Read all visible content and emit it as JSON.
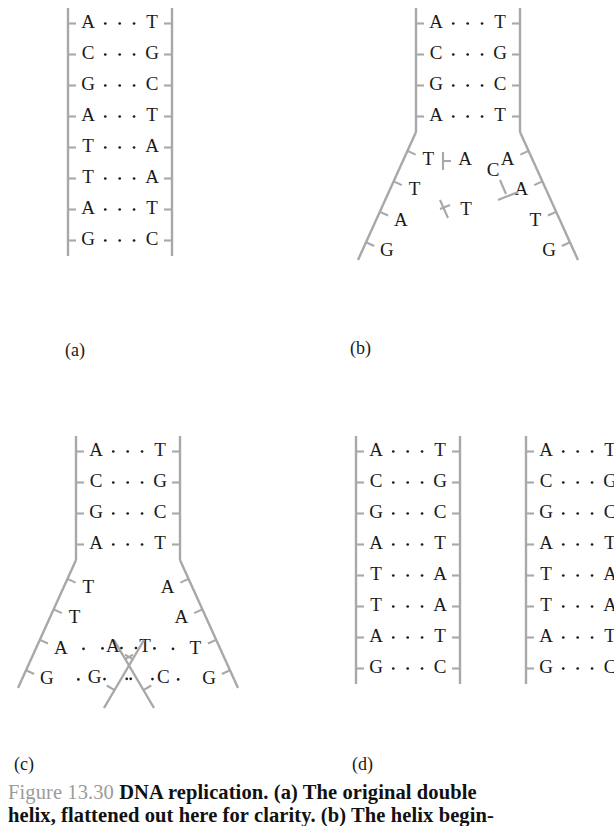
{
  "figure": {
    "number": "Figure 13.30",
    "caption_line1": "DNA replication. (a) The original double",
    "caption_line2": "helix, flattened out here for clarity. (b) The helix begin-",
    "title": "DNA replication"
  },
  "colors": {
    "backbone": "#a8a8a8",
    "base_text": "#1a1a1a",
    "figure_number": "#9b9b9b",
    "background": "#ffffff"
  },
  "panels": [
    {
      "id": "a",
      "label": "(a)",
      "description": "The original double helix, flattened out for clarity",
      "base_pairs": [
        {
          "left": "A",
          "right": "T"
        },
        {
          "left": "C",
          "right": "G"
        },
        {
          "left": "G",
          "right": "C"
        },
        {
          "left": "A",
          "right": "T"
        },
        {
          "left": "T",
          "right": "A"
        },
        {
          "left": "T",
          "right": "A"
        },
        {
          "left": "A",
          "right": "T"
        },
        {
          "left": "G",
          "right": "C"
        }
      ]
    },
    {
      "id": "b",
      "label": "(b)",
      "description": "The helix begins to unwind, free nucleotides approach the exposed bases",
      "paired_region": [
        {
          "left": "A",
          "right": "T"
        },
        {
          "left": "C",
          "right": "G"
        },
        {
          "left": "G",
          "right": "C"
        },
        {
          "left": "A",
          "right": "T"
        }
      ],
      "left_unpaired": [
        "T",
        "T",
        "A",
        "G"
      ],
      "right_unpaired": [
        "A",
        "A",
        "T",
        "G"
      ],
      "free_nucleotides": [
        "A",
        "T",
        "C"
      ]
    },
    {
      "id": "c",
      "label": "(c)",
      "description": "New complementary strands form along each template strand",
      "paired_region": [
        {
          "left": "A",
          "right": "T"
        },
        {
          "left": "C",
          "right": "G"
        },
        {
          "left": "G",
          "right": "C"
        },
        {
          "left": "A",
          "right": "T"
        }
      ],
      "left_template": [
        "T",
        "T",
        "A",
        "G"
      ],
      "left_new": [
        "T",
        "C"
      ],
      "right_template": [
        "A",
        "A",
        "T",
        "G"
      ],
      "right_new": [
        "A",
        "G"
      ]
    },
    {
      "id": "d",
      "label": "(d)",
      "description": "Two identical daughter double helices",
      "helix_left": [
        {
          "left": "A",
          "right": "T"
        },
        {
          "left": "C",
          "right": "G"
        },
        {
          "left": "G",
          "right": "C"
        },
        {
          "left": "A",
          "right": "T"
        },
        {
          "left": "T",
          "right": "A"
        },
        {
          "left": "T",
          "right": "A"
        },
        {
          "left": "A",
          "right": "T"
        },
        {
          "left": "G",
          "right": "C"
        }
      ],
      "helix_right": [
        {
          "left": "A",
          "right": "T"
        },
        {
          "left": "C",
          "right": "G"
        },
        {
          "left": "G",
          "right": "C"
        },
        {
          "left": "A",
          "right": "T"
        },
        {
          "left": "T",
          "right": "A"
        },
        {
          "left": "T",
          "right": "A"
        },
        {
          "left": "A",
          "right": "T"
        },
        {
          "left": "G",
          "right": "C"
        }
      ]
    }
  ]
}
